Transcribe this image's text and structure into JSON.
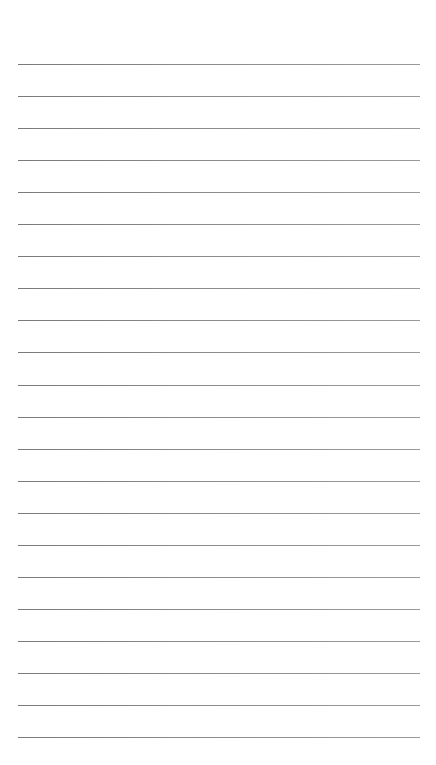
{
  "page": {
    "type": "lined-paper",
    "background_color": "#ffffff",
    "line_color": "#8a8a8a",
    "line_count": 22,
    "first_line_y": 64,
    "line_spacing": 32.05,
    "line_left": 18,
    "line_width": 402
  }
}
